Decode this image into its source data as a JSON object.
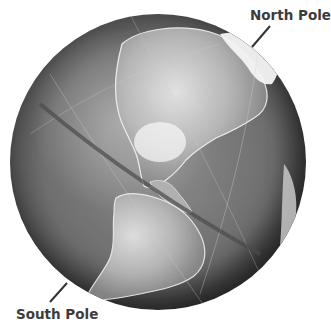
{
  "figure": {
    "title_fragment": "g",
    "labels": {
      "north_pole": "North Pole",
      "south_pole": "South Pole"
    },
    "colors": {
      "label_text": "#3c3c3c",
      "leader_line": "#333333",
      "background": "#ffffff"
    }
  }
}
